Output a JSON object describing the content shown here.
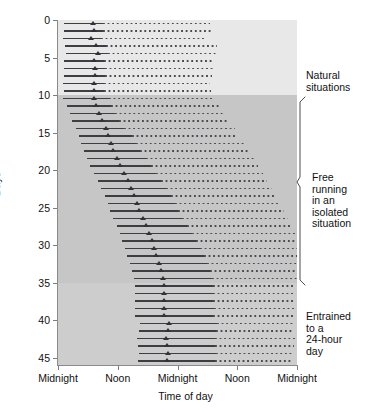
{
  "chart_data": {
    "type": "actogram",
    "title": "",
    "xlabel": "Time of day",
    "ylabel": "Days",
    "xlim": [
      0,
      48
    ],
    "ylim": [
      0,
      46
    ],
    "grid": false,
    "x_tick_positions": [
      0,
      12,
      24,
      36,
      48
    ],
    "x_tick_labels": [
      "Midnight",
      "Noon",
      "Midnight",
      "Noon",
      "Midnight"
    ],
    "y_tick_positions": [
      0,
      5,
      10,
      15,
      20,
      25,
      30,
      35,
      40,
      45
    ],
    "y_tick_labels": [
      "0",
      "5",
      "10",
      "15",
      "20",
      "25",
      "30",
      "35",
      "40",
      "45"
    ],
    "series_note": "Double-plotted actogram: each row shows 48 h. Solid line = recorded activity bout, triangle = activity onset, dotted line = replotted / projected activity.",
    "phases": [
      {
        "name": "Natural situations",
        "day_start": 0,
        "day_end": 10,
        "shade": "#e8e8e8"
      },
      {
        "name": "Free running in an isolated situation",
        "day_start": 10,
        "day_end": 35,
        "shade": "#c6c6c6"
      },
      {
        "name": "Entrained to a 24-hour day",
        "day_start": 35,
        "day_end": 46,
        "shade": "#cdcdcd"
      }
    ],
    "rows": [
      {
        "day": 0,
        "solid_start": 1.2,
        "onset": 7.1,
        "solid_end": 9.0,
        "dotted_end": 30.6
      },
      {
        "day": 1,
        "solid_start": 1.2,
        "onset": 7.2,
        "solid_end": 9.1,
        "dotted_end": 30.7
      },
      {
        "day": 2,
        "solid_start": 1.0,
        "onset": 6.6,
        "solid_end": 8.6,
        "dotted_end": 29.8
      },
      {
        "day": 3,
        "solid_start": 1.5,
        "onset": 7.6,
        "solid_end": 9.6,
        "dotted_end": 32.0
      },
      {
        "day": 4,
        "solid_start": 1.6,
        "onset": 8.0,
        "solid_end": 10.0,
        "dotted_end": 32.2
      },
      {
        "day": 5,
        "solid_start": 1.3,
        "onset": 7.3,
        "solid_end": 9.2,
        "dotted_end": 31.2
      },
      {
        "day": 6,
        "solid_start": 1.3,
        "onset": 7.4,
        "solid_end": 9.4,
        "dotted_end": 31.4
      },
      {
        "day": 7,
        "solid_start": 1.2,
        "onset": 7.4,
        "solid_end": 9.4,
        "dotted_end": 31.0
      },
      {
        "day": 8,
        "solid_start": 1.1,
        "onset": 7.2,
        "solid_end": 9.2,
        "dotted_end": 30.6
      },
      {
        "day": 9,
        "solid_start": 1.2,
        "onset": 7.3,
        "solid_end": 9.3,
        "dotted_end": 30.8
      },
      {
        "day": 10,
        "solid_start": 1.0,
        "onset": 7.2,
        "solid_end": 10.2,
        "dotted_end": 31.4
      },
      {
        "day": 11,
        "solid_start": 1.9,
        "onset": 7.7,
        "solid_end": 10.6,
        "dotted_end": 32.4
      },
      {
        "day": 12,
        "solid_start": 2.4,
        "onset": 8.3,
        "solid_end": 11.4,
        "dotted_end": 33.6
      },
      {
        "day": 13,
        "solid_start": 2.9,
        "onset": 8.8,
        "solid_end": 12.2,
        "dotted_end": 34.4
      },
      {
        "day": 14,
        "solid_start": 3.6,
        "onset": 9.6,
        "solid_end": 13.2,
        "dotted_end": 35.6
      },
      {
        "day": 15,
        "solid_start": 4.3,
        "onset": 10.1,
        "solid_end": 14.8,
        "dotted_end": 36.0
      },
      {
        "day": 16,
        "solid_start": 4.7,
        "onset": 10.6,
        "solid_end": 15.6,
        "dotted_end": 37.4
      },
      {
        "day": 17,
        "solid_start": 5.3,
        "onset": 11.1,
        "solid_end": 16.4,
        "dotted_end": 38.2
      },
      {
        "day": 18,
        "solid_start": 5.9,
        "onset": 11.8,
        "solid_end": 17.6,
        "dotted_end": 39.4
      },
      {
        "day": 19,
        "solid_start": 6.5,
        "onset": 12.5,
        "solid_end": 18.6,
        "dotted_end": 40.2
      },
      {
        "day": 20,
        "solid_start": 7.3,
        "onset": 13.3,
        "solid_end": 19.6,
        "dotted_end": 41.2
      },
      {
        "day": 21,
        "solid_start": 8.0,
        "onset": 14.0,
        "solid_end": 20.6,
        "dotted_end": 42.0
      },
      {
        "day": 22,
        "solid_start": 8.7,
        "onset": 14.7,
        "solid_end": 21.6,
        "dotted_end": 43.0
      },
      {
        "day": 23,
        "solid_start": 9.4,
        "onset": 15.2,
        "solid_end": 22.6,
        "dotted_end": 43.8
      },
      {
        "day": 24,
        "solid_start": 10.0,
        "onset": 15.8,
        "solid_end": 23.4,
        "dotted_end": 44.6
      },
      {
        "day": 25,
        "solid_start": 10.4,
        "onset": 16.2,
        "solid_end": 24.2,
        "dotted_end": 45.4
      },
      {
        "day": 26,
        "solid_start": 11.1,
        "onset": 17.0,
        "solid_end": 25.0,
        "dotted_end": 46.2
      },
      {
        "day": 27,
        "solid_start": 11.8,
        "onset": 17.7,
        "solid_end": 26.0,
        "dotted_end": 47.0
      },
      {
        "day": 28,
        "solid_start": 12.4,
        "onset": 18.3,
        "solid_end": 27.0,
        "dotted_end": 47.6
      },
      {
        "day": 29,
        "solid_start": 12.9,
        "onset": 18.8,
        "solid_end": 27.8,
        "dotted_end": 48.0
      },
      {
        "day": 30,
        "solid_start": 13.4,
        "onset": 19.3,
        "solid_end": 28.6,
        "dotted_end": 48.0
      },
      {
        "day": 31,
        "solid_start": 13.9,
        "onset": 19.8,
        "solid_end": 29.4,
        "dotted_end": 48.0
      },
      {
        "day": 32,
        "solid_start": 14.4,
        "onset": 20.3,
        "solid_end": 30.0,
        "dotted_end": 48.0
      },
      {
        "day": 33,
        "solid_start": 14.9,
        "onset": 20.8,
        "solid_end": 30.6,
        "dotted_end": 48.0
      },
      {
        "day": 34,
        "solid_start": 15.3,
        "onset": 21.2,
        "solid_end": 31.0,
        "dotted_end": 48.0
      },
      {
        "day": 35,
        "solid_start": 15.4,
        "onset": 21.4,
        "solid_end": 31.2,
        "dotted_end": 47.6
      },
      {
        "day": 36,
        "solid_start": 15.4,
        "onset": 21.4,
        "solid_end": 31.2,
        "dotted_end": 47.4
      },
      {
        "day": 37,
        "solid_start": 15.4,
        "onset": 21.4,
        "solid_end": 31.2,
        "dotted_end": 47.6
      },
      {
        "day": 38,
        "solid_start": 15.4,
        "onset": 21.4,
        "solid_end": 31.4,
        "dotted_end": 47.6
      },
      {
        "day": 39,
        "solid_start": 15.4,
        "onset": 21.4,
        "solid_end": 31.2,
        "dotted_end": 47.4
      },
      {
        "day": 40,
        "solid_start": 16.4,
        "onset": 22.3,
        "solid_end": 32.0,
        "dotted_end": 47.6
      },
      {
        "day": 41,
        "solid_start": 16.2,
        "onset": 22.1,
        "solid_end": 31.8,
        "dotted_end": 47.4
      },
      {
        "day": 42,
        "solid_start": 15.8,
        "onset": 21.8,
        "solid_end": 31.6,
        "dotted_end": 47.6
      },
      {
        "day": 43,
        "solid_start": 16.0,
        "onset": 21.9,
        "solid_end": 31.6,
        "dotted_end": 47.4
      },
      {
        "day": 44,
        "solid_start": 16.3,
        "onset": 22.2,
        "solid_end": 31.8,
        "dotted_end": 47.0
      },
      {
        "day": 45,
        "solid_start": 16.1,
        "onset": 22.0,
        "solid_end": 31.6,
        "dotted_end": 46.8
      }
    ]
  },
  "annotations": {
    "natural": "Natural\nsituations",
    "free_running": "Free\nrunning\nin an\nisolated\nsituation",
    "entrained": "Entrained\nto a\n24-hour\nday"
  },
  "colors": {
    "band_light": "#e8e8e8",
    "band_dark": "#c6c6c6",
    "band_mid": "#cdcdcd",
    "line": "#3d3d42",
    "marker": "#31313a",
    "axis": "#8a8a8a",
    "text": "#111111"
  }
}
